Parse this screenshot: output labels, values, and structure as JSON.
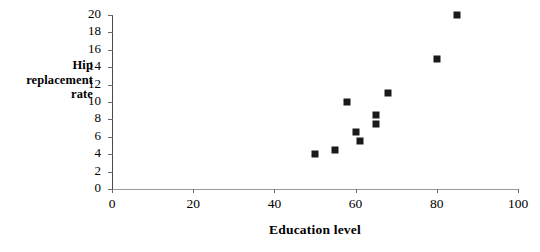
{
  "chart_data": {
    "type": "scatter",
    "title": "",
    "xlabel": "Education level",
    "ylabel": "Hip replacement rate",
    "ylabel_lines": [
      "Hip",
      "replacement",
      "rate"
    ],
    "xlim": [
      0,
      100
    ],
    "ylim": [
      0,
      20
    ],
    "xticks": [
      0,
      20,
      40,
      60,
      80,
      100
    ],
    "yticks": [
      0,
      2,
      4,
      6,
      8,
      10,
      12,
      14,
      16,
      18,
      20
    ],
    "xtick_labels": [
      "0",
      "20",
      "40",
      "60",
      "80",
      "100"
    ],
    "ytick_labels": [
      "0",
      "2",
      "4",
      "6",
      "8",
      "10",
      "12",
      "14",
      "16",
      "18",
      "20"
    ],
    "grid": false,
    "legend": null,
    "marker": "square",
    "marker_color": "#1a1a1a",
    "points": [
      {
        "x": 50,
        "y": 4.0
      },
      {
        "x": 55,
        "y": 4.5
      },
      {
        "x": 58,
        "y": 10.0
      },
      {
        "x": 60,
        "y": 6.5
      },
      {
        "x": 61,
        "y": 5.5
      },
      {
        "x": 65,
        "y": 8.5
      },
      {
        "x": 65,
        "y": 7.5
      },
      {
        "x": 68,
        "y": 11.0
      },
      {
        "x": 80,
        "y": 15.0
      },
      {
        "x": 85,
        "y": 20.0
      }
    ]
  }
}
